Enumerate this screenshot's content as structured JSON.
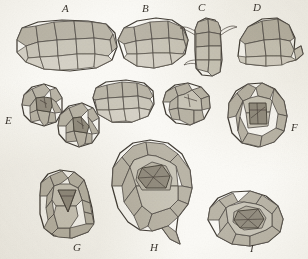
{
  "plate": {
    "kind": "botanical-histology-plate",
    "caption_letters": [
      "A",
      "B",
      "C",
      "D",
      "E",
      "F",
      "G",
      "H",
      "I"
    ],
    "background_color": "#fbfaf6",
    "ink_color": "#4a443c",
    "cell_fill_light": "#cdc9bd",
    "cell_fill_mid": "#b7b2a4",
    "cell_fill_dark": "#8d8779",
    "figures": [
      {
        "id": "A",
        "label": "A",
        "label_x": 62,
        "label_y": 4,
        "description": "wide oblong tissue section of irregular polygonal cells",
        "x": 14,
        "y": 20,
        "w": 104,
        "h": 52
      },
      {
        "id": "B",
        "label": "B",
        "label_x": 143,
        "label_y": 4,
        "description": "broad lobed tissue section of polygonal cells",
        "x": 116,
        "y": 18,
        "w": 72,
        "h": 52
      },
      {
        "id": "C",
        "label": "C",
        "label_x": 199,
        "label_y": 3,
        "description": "narrow upright column with lateral papillae",
        "x": 190,
        "y": 18,
        "w": 36,
        "h": 58
      },
      {
        "id": "D",
        "label": "D",
        "label_x": 254,
        "label_y": 3,
        "description": "dome-shaped section with lateral flange on right",
        "x": 236,
        "y": 18,
        "w": 66,
        "h": 50
      },
      {
        "id": "E",
        "label": "E",
        "label_x": 6,
        "label_y": 117,
        "description": "paired rounded cell groups each with dark central archegonium",
        "x": 12,
        "y": 84,
        "w": 86,
        "h": 62
      },
      {
        "id": "F",
        "label": "F",
        "label_x": 292,
        "label_y": 124,
        "description": "bell-shaped section with dark rectangular central cell mass",
        "x": 224,
        "y": 84,
        "w": 66,
        "h": 66
      },
      {
        "id": "G",
        "label": "G",
        "label_x": 74,
        "label_y": 244,
        "description": "rounded section with dark triangular central cell",
        "x": 38,
        "y": 170,
        "w": 62,
        "h": 68
      },
      {
        "id": "H",
        "label": "H",
        "label_x": 151,
        "label_y": 244,
        "description": "large flask-shaped body with concentric cell layers and stalk",
        "x": 110,
        "y": 140,
        "w": 88,
        "h": 100
      },
      {
        "id": "I",
        "label": "I",
        "label_x": 250,
        "label_y": 245,
        "description": "oval section with concentric cell rings around dark centre",
        "x": 206,
        "y": 192,
        "w": 80,
        "h": 56
      },
      {
        "id": "B2",
        "label": "",
        "description": "unlabelled rounded section below B",
        "x": 92,
        "y": 80,
        "w": 64,
        "h": 44
      },
      {
        "id": "C2",
        "label": "",
        "description": "unlabelled small rounded section below C",
        "x": 162,
        "y": 82,
        "w": 50,
        "h": 44
      }
    ]
  }
}
